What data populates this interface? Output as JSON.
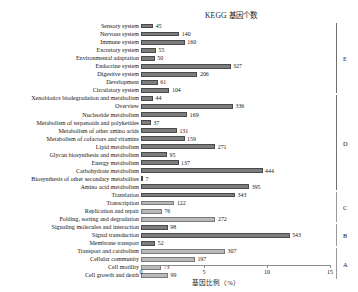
{
  "chart_data": {
    "type": "bar",
    "orientation": "horizontal",
    "title": "KEGG 基因个数",
    "xlabel": "基因比例（%）",
    "ylabel": "",
    "xlim": [
      0,
      15
    ],
    "xticks": [
      0,
      5,
      10,
      15
    ],
    "xtick_labels": [
      "0",
      "5",
      "10",
      "15"
    ],
    "grid": false,
    "legend": false,
    "value_unit": "gene count",
    "note": "Bar length encodes percent of genes; printed number is the gene count.",
    "categories": [
      "Sensory system",
      "Nervous system",
      "Immune system",
      "Excretory system",
      "Environmental adaptation",
      "Endocrine system",
      "Digestive system",
      "Development",
      "Circulatory system",
      "Xenobiotics biodegradation and metabolism",
      "Overview",
      "Nucleotide metabolism",
      "Metabolism of terpenoids and polyketides",
      "Metabolism of other amino acids",
      "Metabolism of cofactors and vitamins",
      "Lipid metabolism",
      "Glycan biosynthesis and metabolism",
      "Energy metabolism",
      "Carbohydrate metabolism",
      "Biosynthesis of other secondary metabolites",
      "Amino acid metabolism",
      "Translation",
      "Transcription",
      "Replication and repair",
      "Folding, sorting and degradation",
      "Signaling molecules and interaction",
      "Signal transduction",
      "Membrane transport",
      "Transport and catabolism",
      "Cellular community",
      "Cell motility",
      "Cell growth and death"
    ],
    "values": [
      45,
      140,
      160,
      55,
      50,
      327,
      206,
      61,
      104,
      44,
      336,
      169,
      37,
      131,
      159,
      271,
      95,
      137,
      444,
      7,
      395,
      343,
      122,
      76,
      272,
      98,
      543,
      52,
      307,
      197,
      73,
      99
    ],
    "percents": [
      0.98,
      3.04,
      3.48,
      1.2,
      1.09,
      7.11,
      4.48,
      1.33,
      2.26,
      0.96,
      7.3,
      3.67,
      0.8,
      2.85,
      3.46,
      5.89,
      2.07,
      2.98,
      9.65,
      0.15,
      8.59,
      7.46,
      2.65,
      1.65,
      5.91,
      2.13,
      11.8,
      1.13,
      6.67,
      4.28,
      1.59,
      2.15
    ],
    "bar_shades": [
      "dark",
      "dark",
      "dark",
      "dark",
      "dark",
      "dark",
      "dark",
      "dark",
      "dark",
      "dark",
      "dark",
      "dark",
      "dark",
      "dark",
      "dark",
      "dark",
      "dark",
      "dark",
      "dark",
      "dark",
      "dark",
      "dark",
      "light",
      "light",
      "light",
      "dark",
      "dark",
      "dark",
      "light",
      "light",
      "light",
      "light"
    ],
    "groups": [
      {
        "label": "E",
        "start_index": 0,
        "end_index": 8
      },
      {
        "label": "D",
        "start_index": 9,
        "end_index": 20
      },
      {
        "label": "C",
        "start_index": 21,
        "end_index": 24
      },
      {
        "label": "B",
        "start_index": 25,
        "end_index": 27
      },
      {
        "label": "A",
        "start_index": 28,
        "end_index": 31
      }
    ],
    "colors": {
      "bar_dark": "#7d7d7d",
      "bar_light": "#b9b9b9",
      "bar_edge": "#4a4a4a",
      "axis": "#8d8d8d",
      "text": "#161616",
      "background": "#ffffff"
    }
  }
}
